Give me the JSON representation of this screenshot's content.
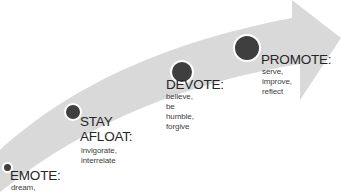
{
  "diagram": {
    "type": "curved-arrow-process",
    "arrow_color": "#d9d9d9",
    "dot_color": "#3f3f3f",
    "stages": [
      {
        "title": "EMOTE:",
        "description": "dream,\n..."
      },
      {
        "title": "STAY\nAFLOAT:",
        "title_line1": "STAY",
        "title_line2": "AFLOAT:",
        "description": "invigorate,\ninterrelate"
      },
      {
        "title": "DEVOTE:",
        "description": "believe, be\nhumble, forgive"
      },
      {
        "title": "PROMOTE:",
        "description": "serve, improve,\nreflect"
      }
    ]
  }
}
